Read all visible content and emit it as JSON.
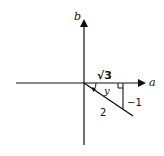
{
  "diagram": {
    "type": "complex-plane-triangle",
    "axes": {
      "horizontal_label": "a",
      "vertical_label": "b"
    },
    "triangle": {
      "adjacent_label": "√3",
      "opposite_label": "−1",
      "hypotenuse_label": "2",
      "angle_label": "y",
      "right_angle_marker": true
    },
    "colors": {
      "stroke": "#111111",
      "background": "#ffffff"
    }
  }
}
